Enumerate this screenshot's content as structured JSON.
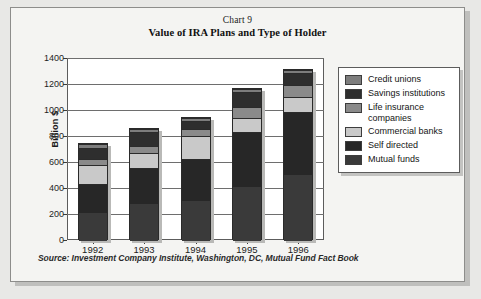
{
  "card": {
    "background": "#f4f4f2",
    "border_color": "#8d8d8b"
  },
  "header": {
    "chart_number": "Chart 9",
    "title": "Value of IRA Plans and Type of Holder"
  },
  "footer": {
    "source": "Source: Investment Company Institute, Washington, DC, Mutual Fund Fact Book"
  },
  "axes": {
    "ylabel": "Billion $",
    "yticks": [
      "1400",
      "1200",
      "1000",
      "800",
      "600",
      "400",
      "200",
      "0"
    ],
    "xticks": [
      "1992",
      "1993",
      "1994",
      "1995",
      "1996"
    ]
  },
  "legend": {
    "entries": [
      {
        "label": "Credit unions",
        "color": "#7d7d7d"
      },
      {
        "label": "Savings institutions",
        "color": "#2e2e2e"
      },
      {
        "label": "Life insurance companies",
        "color": "#8a8a8a"
      },
      {
        "label": "Commercial banks",
        "color": "#c9c9c9"
      },
      {
        "label": "Self directed",
        "color": "#272727"
      },
      {
        "label": "Mutual funds",
        "color": "#3a3a3a"
      }
    ]
  },
  "chart_data": {
    "type": "bar",
    "stacked": true,
    "title": "Value of IRA Plans and Type of Holder",
    "subtitle": "Chart 9",
    "xlabel": "",
    "ylabel": "Billion $",
    "ylim": [
      0,
      1400
    ],
    "ytick_step": 200,
    "grid": true,
    "legend_position": "right",
    "categories": [
      "1992",
      "1993",
      "1994",
      "1995",
      "1996"
    ],
    "series": [
      {
        "name": "Mutual funds",
        "color": "#3a3a3a",
        "values": [
          215,
          285,
          305,
          415,
          510
        ]
      },
      {
        "name": "Self directed",
        "color": "#272727",
        "values": [
          225,
          275,
          325,
          420,
          480
        ]
      },
      {
        "name": "Commercial banks",
        "color": "#c9c9c9",
        "values": [
          145,
          115,
          175,
          110,
          120
        ]
      },
      {
        "name": "Life insurance companies",
        "color": "#8a8a8a",
        "values": [
          45,
          55,
          60,
          85,
          90
        ]
      },
      {
        "name": "Savings institutions",
        "color": "#2e2e2e",
        "values": [
          85,
          105,
          55,
          115,
          90
        ]
      },
      {
        "name": "Credit unions",
        "color": "#7d7d7d",
        "values": [
          35,
          30,
          25,
          25,
          25
        ]
      }
    ],
    "totals": [
      750,
      865,
      945,
      1170,
      1315
    ],
    "annotations": [
      "Source: Investment Company Institute, Washington, DC, Mutual Fund Fact Book"
    ]
  }
}
